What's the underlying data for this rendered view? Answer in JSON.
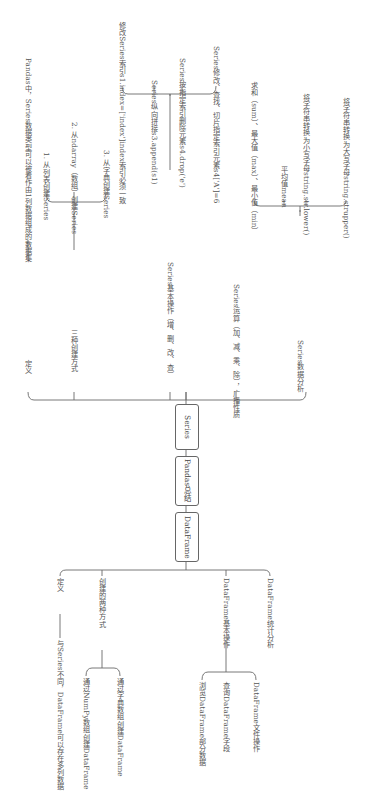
{
  "root": {
    "label": "Pandas总结"
  },
  "series": {
    "label": "Series",
    "branches": [
      {
        "label": "定义",
        "child": "Pandas中，Series数据类型可以被看作由1列数据组成的数据集"
      },
      {
        "label": "三种创建方式",
        "children": [
          "1. 从列表创建Series",
          "2. 从ndarray（数组）创建Series",
          "3. 从字典创建Series"
        ]
      },
      {
        "label": "Series基本操作（增、删、改、查）",
        "children": [
          "修改Series索引s1.index=['index']index索引必须一致",
          "Series纵向拼接s3.append(s1)",
          "Series按指定索引删除元素s4.drop('e')",
          "Series修改、查找、切片指定索引元素s4['A']=6"
        ]
      },
      {
        "label": "Series运算（加、减、乘、除），广播性质"
      },
      {
        "label": "Series数据分析",
        "children": [
          "求和（sum）、最大值（max）、最小值（min）",
          "平均值mean",
          "将字符串转换为小写字母string.str.lower()",
          "将字符串转换为大写字母string.strupper()"
        ]
      }
    ]
  },
  "dataframe": {
    "label": "DataFrame",
    "branches": [
      {
        "label": "定义",
        "child": "与Series不同，DataFrame可以存在多列数据"
      },
      {
        "label": "创建的两种方式",
        "children": [
          "通过NumPy数组创建DataFrame",
          "通过字典数组创建DataFrame"
        ]
      },
      {
        "label": "DataFrame基本操作",
        "children": [
          "浏览DataFrame部分数据",
          "查询DataFrame字段",
          "DataFrame文件操作"
        ]
      },
      {
        "label": "DataFrame统计分析"
      }
    ]
  },
  "colors": {
    "line": "#6a6a6a",
    "text": "#555555",
    "background": "#ffffff"
  }
}
